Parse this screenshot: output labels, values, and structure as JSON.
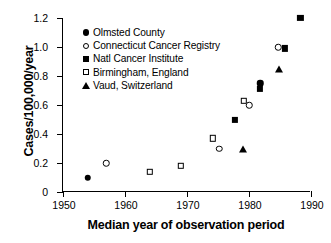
{
  "chart_data": {
    "type": "scatter",
    "title": "",
    "xlabel": "Median year of observation period",
    "ylabel": "Cases/100,000/year",
    "xlim": [
      1950,
      1990
    ],
    "ylim": [
      0,
      1.2
    ],
    "xticks": [
      "1950",
      "1960",
      "1970",
      "1980",
      "1990"
    ],
    "yticks": [
      "0",
      "0.2",
      "0.4",
      "0.6",
      "0.8",
      "1.0",
      "1.2"
    ],
    "grid": false,
    "legend_position": "upper-left-inside",
    "series": [
      {
        "name": "Olmsted County",
        "marker": "filled-circle",
        "color": "#000000",
        "points": [
          {
            "x": 1954.0,
            "y": 0.1
          },
          {
            "x": 1981.8,
            "y": 0.75
          }
        ]
      },
      {
        "name": "Connecticut Cancer Registry",
        "marker": "open-circle",
        "color": "#000000",
        "points": [
          {
            "x": 1957.0,
            "y": 0.2
          },
          {
            "x": 1975.2,
            "y": 0.3
          },
          {
            "x": 1980.0,
            "y": 0.6
          },
          {
            "x": 1984.7,
            "y": 1.0
          }
        ]
      },
      {
        "name": "Natl Cancer Institute",
        "marker": "filled-square",
        "color": "#000000",
        "points": [
          {
            "x": 1977.7,
            "y": 0.5
          },
          {
            "x": 1981.8,
            "y": 0.71
          },
          {
            "x": 1985.8,
            "y": 0.99
          },
          {
            "x": 1988.3,
            "y": 1.2
          }
        ]
      },
      {
        "name": "Birmingham, England",
        "marker": "open-square",
        "color": "#000000",
        "points": [
          {
            "x": 1964.0,
            "y": 0.14
          },
          {
            "x": 1969.0,
            "y": 0.18
          },
          {
            "x": 1974.2,
            "y": 0.37
          },
          {
            "x": 1979.2,
            "y": 0.63
          }
        ]
      },
      {
        "name": "Vaud, Switzerland",
        "marker": "filled-triangle",
        "color": "#000000",
        "points": [
          {
            "x": 1979.0,
            "y": 0.3
          },
          {
            "x": 1984.8,
            "y": 0.85
          }
        ]
      }
    ]
  },
  "legend": {
    "items": [
      {
        "label": "Olmsted County",
        "marker": "filled-circle"
      },
      {
        "label": "Connecticut Cancer Registry",
        "marker": "open-circle"
      },
      {
        "label": "Natl Cancer Institute",
        "marker": "filled-square"
      },
      {
        "label": "Birmingham, England",
        "marker": "open-square"
      },
      {
        "label": "Vaud, Switzerland",
        "marker": "filled-triangle"
      }
    ]
  }
}
